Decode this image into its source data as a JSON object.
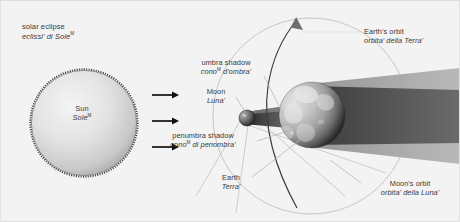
{
  "diagram": {
    "title": {
      "en": "solar eclipse",
      "it": "eclissi' di Sole",
      "it_sup": "M"
    },
    "background_color": "#f3f3f3",
    "text_color": "#3a3a3a"
  },
  "labels": {
    "sun": {
      "en": "Sun",
      "it": "Sole",
      "it_sup": "M"
    },
    "umbra": {
      "en": "umbra shadow",
      "it": "cono",
      "it_sup": "M",
      "it_tail": " d'ombra'"
    },
    "moon": {
      "en": "Moon",
      "it": "Luna'",
      "it_sup": ""
    },
    "penumbra": {
      "en": "penumbra shadow",
      "it": "cono",
      "it_sup": "M",
      "it_tail": " di penombra'"
    },
    "earth": {
      "en": "Earth",
      "it": "Terra'",
      "it_sup": ""
    },
    "earth_orbit": {
      "en": "Earth's orbit",
      "it": "orbita' della Terra'",
      "it_sup": ""
    },
    "moon_orbit": {
      "en": "Moon's orbit",
      "it": "orbita' della Luna'",
      "it_sup": ""
    }
  },
  "bodies": {
    "sun": {
      "cx": 84,
      "cy": 123,
      "r": 53,
      "fill_light": "#efefef",
      "fill_dark": "#9a9a9a",
      "rim": "#4a4a4a"
    },
    "moon": {
      "cx": 247,
      "cy": 118,
      "r": 8,
      "fill_light": "#8e8e8e",
      "fill_dark": "#1c1c1c"
    },
    "earth": {
      "cx": 312,
      "cy": 115,
      "r": 33,
      "fill_light": "#cfcfcf",
      "fill_dark": "#141414"
    }
  },
  "shadows": {
    "umbra_color": "#5f5f5f",
    "penumbra_color": "#a8a8a8",
    "earth_umbra_color": "#5b5b5b",
    "earth_penumbra_color": "#a6a6a6"
  },
  "orbits": {
    "earth_orbit_color": "#3c3c3c",
    "moon_orbit_color": "#b5b5b5",
    "leader_color": "#b0b0b0"
  },
  "rays": {
    "color": "#111111",
    "count": 3,
    "arrows": [
      {
        "x1": 152,
        "x2": 175,
        "y": 95
      },
      {
        "x1": 152,
        "x2": 175,
        "y": 121
      },
      {
        "x1": 152,
        "x2": 175,
        "y": 147
      }
    ]
  }
}
